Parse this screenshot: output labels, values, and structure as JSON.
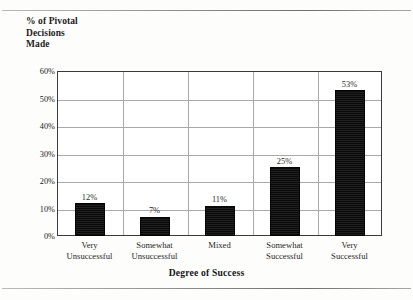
{
  "page": {
    "background_color": "#fdfdfc",
    "rule_color": "#8c8c8c"
  },
  "chart_data": {
    "type": "bar",
    "title": "",
    "subtitle": "",
    "xlabel": "Degree of Success",
    "ylabel": "% of Pivotal\nDecisions\nMade",
    "categories": [
      "Very\nUnsuccessful",
      "Somewhat\nUnsuccessful",
      "Mixed",
      "Somewhat\nSuccessful",
      "Very\nSuccessful"
    ],
    "values": [
      12,
      7,
      11,
      25,
      53
    ],
    "value_labels": [
      "12%",
      "7%",
      "11%",
      "25%",
      "53%"
    ],
    "ylim": [
      0,
      60
    ],
    "ytick_values": [
      0,
      10,
      20,
      30,
      40,
      50,
      60
    ],
    "ytick_labels": [
      "0%",
      "10%",
      "20%",
      "30%",
      "40%",
      "50%",
      "60%"
    ],
    "grid": true,
    "grid_color": "#a9a9a9",
    "legend": false,
    "legend_position": "none",
    "bar_color": "#111111",
    "axis_color": "#3a3a3a"
  }
}
